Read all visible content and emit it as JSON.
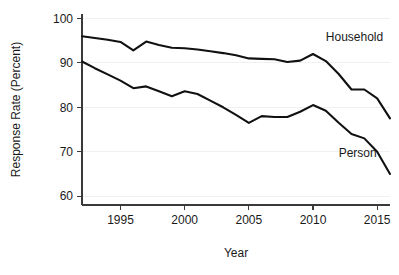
{
  "chart_data": {
    "type": "line",
    "title": "",
    "xlabel": "Year",
    "ylabel": "Response Rate (Percent)",
    "xlim": [
      1992,
      2016
    ],
    "ylim": [
      58,
      101
    ],
    "xticks": [
      1995,
      2000,
      2005,
      2010,
      2015
    ],
    "xtick_labels": [
      "1995",
      "2000",
      "2005",
      "2010",
      "2015"
    ],
    "yticks": [
      60,
      70,
      80,
      90,
      100
    ],
    "ytick_labels": [
      "60",
      "70",
      "80",
      "90",
      "100"
    ],
    "grid": "horizontal-faint",
    "legend_position": "inline-annotations",
    "x": [
      1992,
      1993,
      1994,
      1995,
      1996,
      1997,
      1998,
      1999,
      2000,
      2001,
      2002,
      2003,
      2004,
      2005,
      2006,
      2007,
      2008,
      2009,
      2010,
      2011,
      2012,
      2013,
      2014,
      2015,
      2016
    ],
    "series": [
      {
        "name": "Household",
        "label": "Household",
        "color": "#111111",
        "values": [
          96.0,
          95.6,
          95.2,
          94.7,
          92.8,
          94.8,
          94.0,
          93.4,
          93.3,
          93.0,
          92.6,
          92.2,
          91.7,
          91.0,
          90.9,
          90.8,
          90.2,
          90.5,
          92.0,
          90.4,
          87.5,
          84.0,
          84.0,
          82.0,
          77.5
        ]
      },
      {
        "name": "Person",
        "label": "Person",
        "color": "#111111",
        "values": [
          90.3,
          88.8,
          87.4,
          86.0,
          84.3,
          84.7,
          83.6,
          82.5,
          83.6,
          83.0,
          81.5,
          80.0,
          78.3,
          76.5,
          78.0,
          77.8,
          77.8,
          79.0,
          80.5,
          79.2,
          76.5,
          74.0,
          73.0,
          70.0,
          65.0
        ]
      }
    ],
    "annotations": [
      {
        "text": "Household",
        "x": 2011.0,
        "y": 95.0
      },
      {
        "text": "Person",
        "x": 2012.0,
        "y": 68.8
      }
    ]
  }
}
